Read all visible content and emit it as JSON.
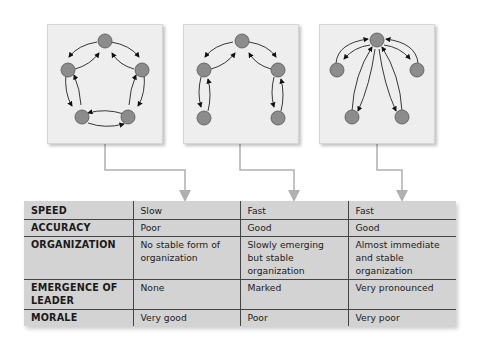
{
  "networks": [
    {
      "name": "circle",
      "label": "Circle network"
    },
    {
      "name": "chain",
      "label": "Chain network"
    },
    {
      "name": "wheel",
      "label": "Wheel network"
    }
  ],
  "colors": {
    "node_fill": "#8c8c8c",
    "node_stroke": "#555555",
    "box_bg": "#eeeeee",
    "table_bg": "#d3d3d3",
    "connector": "#b0b0b0"
  },
  "table": {
    "rows": [
      {
        "label": "SPEED",
        "values": [
          "Slow",
          "Fast",
          "Fast"
        ]
      },
      {
        "label": "ACCURACY",
        "values": [
          "Poor",
          "Good",
          "Good"
        ]
      },
      {
        "label": "ORGANIZATION",
        "values": [
          "No stable form of organization",
          "Slowly emerging but stable organization",
          "Almost immediate and stable organization"
        ]
      },
      {
        "label": "EMERGENCE OF LEADER",
        "values": [
          "None",
          "Marked",
          "Very pronounced"
        ]
      },
      {
        "label": "MORALE",
        "values": [
          "Very good",
          "Poor",
          "Very poor"
        ]
      }
    ]
  }
}
